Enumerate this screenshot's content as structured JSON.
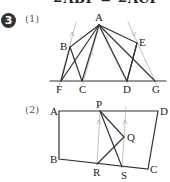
{
  "header": {
    "cut_text": "∠ABF = ∠ACF"
  },
  "problem": {
    "number": "3"
  },
  "figure1": {
    "part_label": "(1)",
    "points": {
      "A": "A",
      "B": "B",
      "C": "C",
      "D": "D",
      "E": "E",
      "F": "F",
      "G": "G"
    }
  },
  "figure2": {
    "part_label": "(2)",
    "points": {
      "A": "A",
      "B": "B",
      "C": "C",
      "D": "D",
      "P": "P",
      "Q": "Q",
      "R": "R",
      "S": "S"
    }
  },
  "colors": {
    "line": "#333333",
    "aux_line": "#888888",
    "badge": "#333333"
  }
}
